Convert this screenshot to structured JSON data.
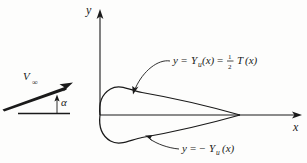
{
  "figure": {
    "background_color": "#fdfdfc",
    "ink_color": "#1a1a1a"
  },
  "axes": {
    "y_label": "y",
    "x_label": "x",
    "origin": {
      "x": 100,
      "y": 115
    },
    "y_axis_top": 12,
    "x_axis_right": 301
  },
  "labels": {
    "upper_surface": {
      "text_full": "y = Yᵤ(x) = ½ T(x)",
      "lhs_y": "y",
      "equals_1": "=",
      "Y": "Y",
      "Y_subscript": "u",
      "of_x_1": "(x)",
      "equals_2": "=",
      "frac_numerator": "1",
      "frac_denominator": "2",
      "T": "T",
      "of_x_2": "(x)"
    },
    "lower_surface": {
      "text_full": "y = − Yᵤ (x)",
      "lhs_y": "y",
      "equals": "=",
      "minus": "−",
      "Y": "Y",
      "Y_subscript": "u",
      "of_x": "(x)"
    },
    "velocity": {
      "symbol": "V",
      "subscript": "∞",
      "text_full": "V∞"
    },
    "angle": {
      "symbol": "α",
      "text_full": "α"
    }
  },
  "geometry": {
    "airfoil": {
      "leading_edge": {
        "x": 100,
        "y": 115
      },
      "trailing_edge": {
        "x": 240,
        "y": 115
      },
      "max_thickness_half": 24,
      "chord_line_visible": true
    },
    "velocity_vector": {
      "tail": {
        "x": 3,
        "y": 108
      },
      "head": {
        "x": 72,
        "y": 83
      },
      "angle_of_attack_degrees": 20
    },
    "reference_line": {
      "x1": 18,
      "x2": 69,
      "y": 113
    },
    "angle_tick": {
      "x": 57,
      "y_top": 96,
      "y_bottom": 113
    }
  },
  "leaders": {
    "upper": {
      "from": {
        "x": 168,
        "y": 62
      },
      "to": {
        "x": 132,
        "y": 92
      }
    },
    "lower": {
      "from": {
        "x": 178,
        "y": 148
      },
      "to": {
        "x": 147,
        "y": 137
      }
    }
  }
}
